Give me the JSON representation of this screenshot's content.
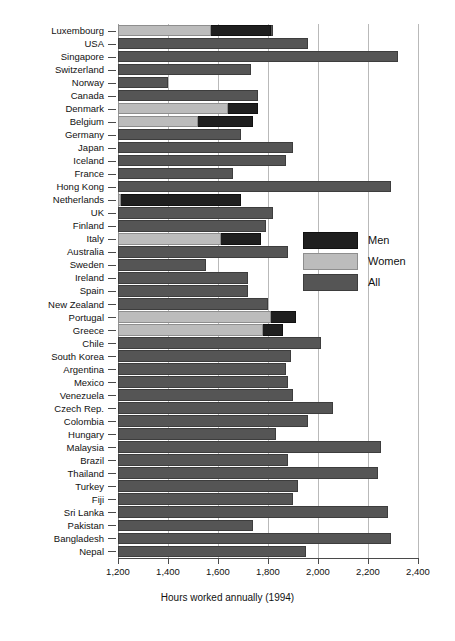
{
  "chart_data": {
    "type": "bar",
    "orientation": "horizontal",
    "title": "",
    "xlabel": "Hours worked annually (1994)",
    "ylabel": "",
    "xlim": [
      1200,
      2400
    ],
    "xticks": [
      "1,200",
      "1,400",
      "1,600",
      "1,800",
      "2,000",
      "2,200",
      "2,400"
    ],
    "xtick_values": [
      1200,
      1400,
      1600,
      1800,
      2000,
      2200,
      2400
    ],
    "grid": "vertical",
    "legend_position": "middle-right",
    "legend": [
      {
        "name": "Men",
        "color": "#1f1f1f"
      },
      {
        "name": "Women",
        "color": "#bcbcbc"
      },
      {
        "name": "All",
        "color": "#555555"
      }
    ],
    "categories": [
      "Luxembourg",
      "USA",
      "Singapore",
      "Switzerland",
      "Norway",
      "Canada",
      "Denmark",
      "Belgium",
      "Germany",
      "Japan",
      "Iceland",
      "France",
      "Hong Kong",
      "Netherlands",
      "UK",
      "Finland",
      "Italy",
      "Australia",
      "Sweden",
      "Ireland",
      "Spain",
      "New Zealand",
      "Portugal",
      "Greece",
      "Chile",
      "South Korea",
      "Argentina",
      "Mexico",
      "Venezuela",
      "Czech Rep.",
      "Colombia",
      "Hungary",
      "Malaysia",
      "Brazil",
      "Thailand",
      "Turkey",
      "Fiji",
      "Sri Lanka",
      "Pakistan",
      "Bangladesh",
      "Nepal"
    ],
    "series": [
      {
        "name": "All",
        "color": "#555555",
        "values": [
          1820,
          1960,
          2320,
          1730,
          1400,
          1760,
          1730,
          1730,
          1690,
          1900,
          1870,
          1660,
          2290,
          1690,
          1820,
          1790,
          1770,
          1880,
          1550,
          1720,
          1720,
          1800,
          1910,
          1760,
          2010,
          1890,
          1870,
          1880,
          1900,
          2060,
          1960,
          1830,
          2250,
          1880,
          2240,
          1920,
          1900,
          2280,
          1740,
          2290,
          1950
        ]
      },
      {
        "name": "Women",
        "color": "#bcbcbc",
        "values": [
          1570,
          null,
          null,
          null,
          null,
          null,
          1640,
          1520,
          null,
          null,
          null,
          null,
          null,
          1210,
          null,
          null,
          1610,
          null,
          null,
          null,
          null,
          null,
          1810,
          1780,
          null,
          null,
          null,
          null,
          null,
          null,
          null,
          null,
          null,
          null,
          null,
          null,
          null,
          null,
          null,
          null,
          null
        ]
      },
      {
        "name": "Men",
        "color": "#1f1f1f",
        "values": [
          1810,
          null,
          null,
          null,
          null,
          null,
          1760,
          1740,
          null,
          null,
          null,
          null,
          null,
          1690,
          null,
          null,
          1770,
          null,
          null,
          null,
          null,
          null,
          1910,
          1860,
          null,
          null,
          null,
          null,
          null,
          null,
          null,
          null,
          null,
          null,
          null,
          null,
          null,
          null,
          null,
          null,
          null
        ]
      }
    ]
  },
  "axis": {
    "x_title": "Hours worked annually (1994)"
  }
}
